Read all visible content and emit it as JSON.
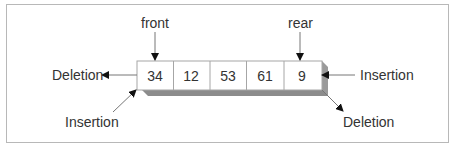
{
  "diagram": {
    "pointers": {
      "front": "front",
      "rear": "rear"
    },
    "cells": [
      "34",
      "12",
      "53",
      "61",
      "9"
    ],
    "left_end": {
      "out_label": "Deletion",
      "in_label": "Insertion"
    },
    "right_end": {
      "in_label": "Insertion",
      "out_label": "Deletion"
    },
    "colors": {
      "border": "#a6a6a6",
      "shadow": "#8c8c8c",
      "text": "#333333",
      "arrow": "#111111",
      "frame": "#b8b8b8"
    }
  }
}
